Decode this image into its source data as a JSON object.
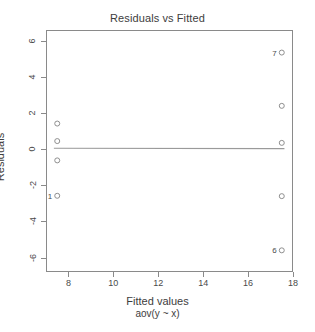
{
  "chart_data": {
    "type": "scatter",
    "title": "Residuals vs Fitted",
    "xlabel": "Fitted values",
    "sublabel": "aov(y ~ x)",
    "ylabel": "Residuals",
    "xlim": [
      7.0,
      18.0
    ],
    "ylim": [
      -6.8,
      6.6
    ],
    "xticks": [
      8,
      10,
      12,
      14,
      16,
      18
    ],
    "xtick_labels": [
      "8",
      "10",
      "12",
      "14",
      "16",
      "18"
    ],
    "yticks": [
      6,
      4,
      2,
      0,
      -2,
      -4,
      -6
    ],
    "ytick_labels": [
      "6",
      "4",
      "2",
      "0",
      "-2",
      "-4",
      "-6"
    ],
    "grid": false,
    "legend": false,
    "marker": "open-circle",
    "marker_color": "#8f8f8f",
    "reference_line": {
      "type": "horizontal-smoother",
      "y": 0.05,
      "color": "#9a9a9a"
    },
    "points": [
      {
        "x": 7.5,
        "y": 1.42,
        "label": ""
      },
      {
        "x": 7.5,
        "y": 0.45,
        "label": ""
      },
      {
        "x": 7.5,
        "y": -0.62,
        "label": ""
      },
      {
        "x": 7.5,
        "y": -2.58,
        "label": "1"
      },
      {
        "x": 17.5,
        "y": 5.35,
        "label": "7"
      },
      {
        "x": 17.5,
        "y": 2.4,
        "label": ""
      },
      {
        "x": 17.5,
        "y": 0.35,
        "label": ""
      },
      {
        "x": 17.5,
        "y": -2.6,
        "label": ""
      },
      {
        "x": 17.5,
        "y": -5.6,
        "label": "6"
      }
    ]
  }
}
